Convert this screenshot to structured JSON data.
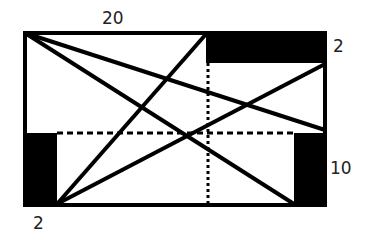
{
  "diagram": {
    "type": "geometry-figure",
    "labels": {
      "top": "20",
      "top_right": "2",
      "right": "10",
      "bottom_left": "2"
    },
    "colors": {
      "stroke": "#000000",
      "fill_block": "#000000",
      "background": "#ffffff",
      "label": "#222222"
    },
    "outer_rect": {
      "x": 25,
      "y": 33,
      "w": 300,
      "h": 172
    },
    "blocks": [
      {
        "name": "top-right-block",
        "x": 206,
        "y": 31,
        "w": 121,
        "h": 32
      },
      {
        "name": "bottom-left-block",
        "x": 23,
        "y": 133,
        "w": 34,
        "h": 73
      },
      {
        "name": "bottom-right-block",
        "x": 294,
        "y": 133,
        "w": 33,
        "h": 73
      }
    ],
    "lines": [
      {
        "name": "line-topleft-to-right",
        "x1": 25,
        "y1": 33,
        "x2": 325,
        "y2": 130
      },
      {
        "name": "line-topleft-to-bottomright",
        "x1": 25,
        "y1": 33,
        "x2": 294,
        "y2": 204
      },
      {
        "name": "line-bottomleft-to-top",
        "x1": 57,
        "y1": 204,
        "x2": 206,
        "y2": 33
      },
      {
        "name": "line-bottomleft-to-right",
        "x1": 57,
        "y1": 204,
        "x2": 325,
        "y2": 64
      }
    ],
    "guides": [
      {
        "name": "dashed-horizontal",
        "x1": 57,
        "y1": 133,
        "x2": 294,
        "y2": 133
      },
      {
        "name": "dotted-vertical",
        "x1": 208,
        "y1": 63,
        "x2": 208,
        "y2": 204
      }
    ]
  }
}
